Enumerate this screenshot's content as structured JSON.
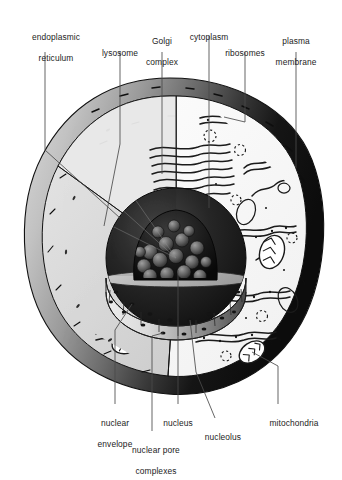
{
  "figure": {
    "type": "labeled-biological-illustration",
    "width": 342,
    "height": 472,
    "background_color": "#ffffff",
    "line_color": "#1c1c1c",
    "label_color": "#1c1c1c"
  },
  "palette": {
    "cytoplasm_fill": "#d9d9d9",
    "cytoplasm_cut_fill": "#ffffff",
    "membrane_light": "#c9c9c9",
    "membrane_mid": "#8a8a8a",
    "membrane_dark": "#151515",
    "nucleus_dark": "#1a1a1a",
    "nucleus_cut_fill": "#b4b4b4",
    "nucleolus_fill": "#111111",
    "leader_line": "#555555"
  },
  "labels": [
    {
      "id": "endoplasmic-reticulum",
      "text": "endoplasmic\nreticulum",
      "lines": [
        "endoplasmic",
        "reticulum"
      ],
      "position": "top-left",
      "x": 12,
      "y": 22,
      "width": 88,
      "leader": {
        "x1": 45,
        "y1": 52,
        "x2": 45,
        "y2": 110
      }
    },
    {
      "id": "lysosome",
      "text": "lysosome",
      "lines": [
        "lysosome"
      ],
      "position": "top",
      "x": 83,
      "y": 38,
      "width": 74,
      "leader": {
        "x1": 120,
        "y1": 52,
        "x2": 120,
        "y2": 95
      }
    },
    {
      "id": "golgi-complex",
      "text": "Golgi\ncomplex",
      "lines": [
        "Golgi",
        "complex"
      ],
      "position": "top",
      "x": 129,
      "y": 26,
      "width": 66,
      "leader": {
        "x1": 162,
        "y1": 52,
        "x2": 162,
        "y2": 102
      }
    },
    {
      "id": "cytoplasm",
      "text": "cytoplasm",
      "lines": [
        "cytoplasm"
      ],
      "position": "top",
      "x": 174,
      "y": 22,
      "width": 70,
      "leader": {
        "x1": 209,
        "y1": 36,
        "x2": 209,
        "y2": 108
      }
    },
    {
      "id": "ribosomes",
      "text": "ribosomes",
      "lines": [
        "ribosomes"
      ],
      "position": "top",
      "x": 209,
      "y": 38,
      "width": 72,
      "leader": {
        "x1": 245,
        "y1": 52,
        "x2": 245,
        "y2": 98
      }
    },
    {
      "id": "plasma-membrane",
      "text": "plasma\nmembrane",
      "lines": [
        "plasma",
        "membrane"
      ],
      "position": "top-right",
      "x": 258,
      "y": 26,
      "width": 76,
      "leader": {
        "x1": 296,
        "y1": 52,
        "x2": 296,
        "y2": 132
      }
    },
    {
      "id": "nuclear-envelope",
      "text": "nuclear\nenvelope",
      "lines": [
        "nuclear",
        "envelope"
      ],
      "position": "bottom-left",
      "x": 80,
      "y": 408,
      "width": 70,
      "leader": {
        "x1": 115,
        "y1": 370,
        "x2": 115,
        "y2": 404
      }
    },
    {
      "id": "nuclear-pore-complexes",
      "text": "nuclear pore\ncomplexes",
      "lines": [
        "nuclear pore",
        "complexes"
      ],
      "position": "bottom-center",
      "x": 110,
      "y": 435,
      "width": 92,
      "leader": {
        "x1": 152,
        "y1": 370,
        "x2": 152,
        "y2": 431
      }
    },
    {
      "id": "nucleus",
      "text": "nucleus",
      "lines": [
        "nucleus"
      ],
      "position": "bottom-center",
      "x": 149,
      "y": 408,
      "width": 58,
      "leader": {
        "x1": 178,
        "y1": 368,
        "x2": 178,
        "y2": 404
      }
    },
    {
      "id": "nucleolus",
      "text": "nucleolus",
      "lines": [
        "nucleolus"
      ],
      "position": "bottom-center-right",
      "x": 190,
      "y": 422,
      "width": 66,
      "leader": {
        "x1": 198,
        "y1": 372,
        "x2": 215,
        "y2": 418
      }
    },
    {
      "id": "mitochondria",
      "text": "mitochondria",
      "lines": [
        "mitochondria"
      ],
      "position": "bottom-right",
      "x": 250,
      "y": 408,
      "width": 88,
      "leader": {
        "x1": 278,
        "y1": 372,
        "x2": 278,
        "y2": 404
      }
    }
  ],
  "structures": [
    {
      "id": "plasma-membrane",
      "name": "plasma membrane",
      "description": "outer shaded rim band encircling the cell, light at upper-left grading to black at right"
    },
    {
      "id": "cytoplasm",
      "name": "cytoplasm",
      "description": "light grey interior field filling the cell body"
    },
    {
      "id": "cut-face",
      "name": "cutaway wedge",
      "description": "white sector removed from the front-right revealing interior"
    },
    {
      "id": "nucleus",
      "name": "nucleus",
      "description": "large central sphere, sectioned, with grey cut surface and dark rim"
    },
    {
      "id": "nucleolus",
      "name": "nucleolus",
      "description": "dark granular dome inside the sectioned nucleus"
    },
    {
      "id": "nuclear-envelope",
      "name": "nuclear envelope",
      "description": "double band forming the rim of the sectioned nucleus"
    },
    {
      "id": "nuclear-pore-complexes",
      "name": "nuclear pore complexes",
      "description": "small dark dots set along the nuclear envelope band"
    },
    {
      "id": "endoplasmic-reticulum",
      "name": "endoplasmic reticulum",
      "description": "long folded tubular membranes threading the cytoplasm, studded with ribosome dots"
    },
    {
      "id": "golgi-complex",
      "name": "Golgi complex",
      "description": "stack of flattened parallel wavy cisternae at upper centre"
    },
    {
      "id": "mitochondria",
      "name": "mitochondria",
      "description": "oval organelles with internal zig-zag cristae"
    },
    {
      "id": "lysosome",
      "name": "lysosome",
      "description": "small round vesicles scattered in the cytoplasm"
    },
    {
      "id": "ribosomes",
      "name": "ribosomes",
      "description": "tiny dots free in cytoplasm and lining the rough ER"
    }
  ]
}
